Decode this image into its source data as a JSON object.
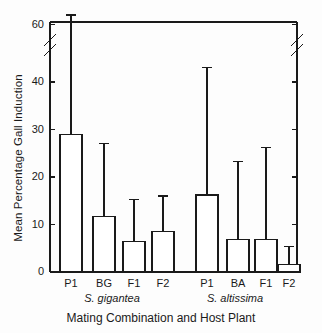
{
  "figure": {
    "top_caption_fragment": "",
    "ylabel": "Mean Percentage Gall Induction",
    "xlabel": "Mating Combination  and Host Plant",
    "axis_color": "#1a1a1a",
    "bar_fill": "#ffffff",
    "bar_stroke": "#1a1a1a"
  },
  "groups": [
    {
      "name": "S. gigantea"
    },
    {
      "name": "S. altissima"
    }
  ],
  "chart_data": {
    "type": "bar",
    "title": "",
    "xlabel": "Mating Combination  and Host Plant",
    "ylabel": "Mean Percentage Gall Induction",
    "ylim": [
      0,
      62
    ],
    "yticks": [
      0,
      10,
      20,
      30,
      40,
      60
    ],
    "ytick_labels": [
      "0",
      "10",
      "20",
      "30",
      "40",
      "60"
    ],
    "axis_break": {
      "present": true,
      "between": [
        44,
        58
      ],
      "sides": [
        "left",
        "right"
      ]
    },
    "grid": false,
    "legend": false,
    "error_bars": "upper only",
    "categories": [
      "P1",
      "BG",
      "F1",
      "F2",
      "P1",
      "BA",
      "F1",
      "F2"
    ],
    "group_labels": [
      "S. gigantea",
      "S. gigantea",
      "S. gigantea",
      "S. gigantea",
      "S. altissima",
      "S. altissima",
      "S. altissima",
      "S. altissima"
    ],
    "values": [
      29.0,
      11.7,
      6.4,
      8.6,
      16.2,
      6.9,
      6.9,
      1.5
    ],
    "error_upper": [
      62.0,
      27.0,
      15.3,
      16.0,
      43.0,
      23.3,
      26.2,
      5.3
    ],
    "series": [
      {
        "name": "Mean Percentage Gall Induction",
        "points": [
          {
            "category": "P1",
            "host": "S. gigantea",
            "value": 29.0,
            "error_top": 62.0
          },
          {
            "category": "BG",
            "host": "S. gigantea",
            "value": 11.7,
            "error_top": 27.0
          },
          {
            "category": "F1",
            "host": "S. gigantea",
            "value": 6.4,
            "error_top": 15.3
          },
          {
            "category": "F2",
            "host": "S. gigantea",
            "value": 8.6,
            "error_top": 16.0
          },
          {
            "category": "P1",
            "host": "S. altissima",
            "value": 16.2,
            "error_top": 43.0
          },
          {
            "category": "BA",
            "host": "S. altissima",
            "value": 6.9,
            "error_top": 23.3
          },
          {
            "category": "F1",
            "host": "S. altissima",
            "value": 6.9,
            "error_top": 26.2
          },
          {
            "category": "F2",
            "host": "S. altissima",
            "value": 1.5,
            "error_top": 5.3
          }
        ]
      }
    ]
  }
}
